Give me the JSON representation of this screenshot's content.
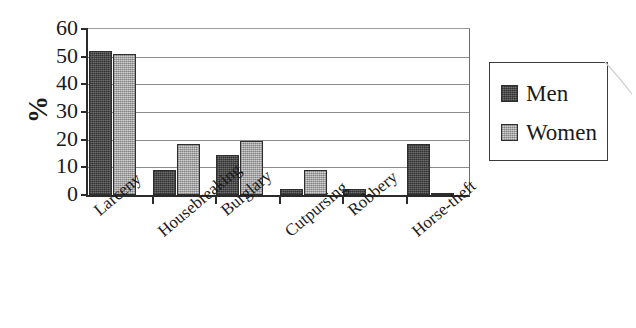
{
  "chart_data": {
    "type": "bar",
    "title": "",
    "subtitle": "",
    "xlabel": "",
    "ylabel": "%",
    "ylim": [
      0,
      60
    ],
    "ytick_step": 10,
    "yticks": [
      60,
      50,
      40,
      30,
      20,
      10,
      0
    ],
    "grid": true,
    "legend_position": "right",
    "categories": [
      "Larceny",
      "Housebreaking",
      "Burglary",
      "Cutpursing",
      "Robbery",
      "Horse-theft"
    ],
    "series": [
      {
        "name": "Men",
        "color": "#5e5e5e",
        "values": [
          52,
          9,
          14.5,
          2,
          2,
          18.5
        ]
      },
      {
        "name": "Women",
        "color": "#b2b2b2",
        "values": [
          51,
          18.5,
          19.5,
          9,
          0,
          0.5
        ]
      }
    ]
  },
  "legend": {
    "items": [
      {
        "label": "Men",
        "swatch": "men-swatch"
      },
      {
        "label": "Women",
        "swatch": "women-swatch"
      }
    ]
  },
  "axes": {
    "y_title": "%",
    "y_labels": [
      "60",
      "50",
      "40",
      "30",
      "20",
      "10",
      "0"
    ],
    "x_labels": [
      "Larceny",
      "Housebreaking",
      "Burglary",
      "Cutpursing",
      "Robbery",
      "Horse-theft"
    ]
  }
}
